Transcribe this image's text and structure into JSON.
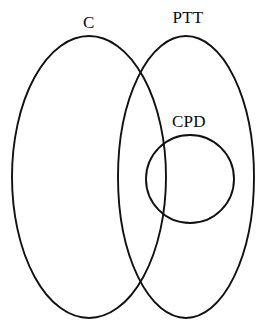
{
  "diagram": {
    "type": "venn-set-diagram",
    "background_color": "#ffffff",
    "stroke_color": "#111111",
    "canvas": {
      "width": 278,
      "height": 332
    },
    "sets": [
      {
        "key": "c",
        "label": "C",
        "shape": "ellipse",
        "center_x": 89,
        "center_y": 177,
        "radius_x": 77,
        "radius_y": 141,
        "label_x": 89,
        "label_y": 22
      },
      {
        "key": "ptt",
        "label": "PTT",
        "shape": "ellipse",
        "center_x": 186,
        "center_y": 177,
        "radius_x": 68,
        "radius_y": 141,
        "label_x": 188,
        "label_y": 17
      },
      {
        "key": "cpd",
        "label": "CPD",
        "shape": "circle",
        "center_x": 190,
        "center_y": 179,
        "radius": 44,
        "label_x": 189,
        "label_y": 121
      }
    ],
    "relations": {
      "overlap_upper_intersection_x": 141,
      "overlap_upper_intersection_y": 69,
      "overlap_lower_intersection_x": 141,
      "overlap_lower_intersection_y": 286
    }
  }
}
